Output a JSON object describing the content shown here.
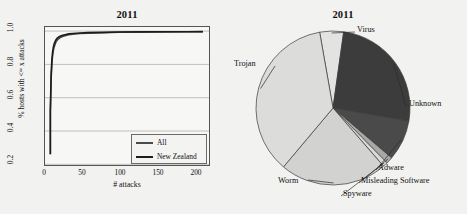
{
  "figure": {
    "background_color": "#f2f2f0",
    "panels": [
      "line-chart",
      "pie-chart"
    ]
  },
  "line_panel": {
    "title": "2011",
    "legend": {
      "entries": [
        {
          "label": "All",
          "color": "#4a4a4a"
        },
        {
          "label": "New Zealand",
          "color": "#1c1c1c"
        }
      ]
    }
  },
  "pie_panel": {
    "title": "2011"
  },
  "chart_data": [
    {
      "type": "line",
      "title": "2011",
      "xlabel": "# attacks",
      "ylabel": "% hosts with <= x attacks",
      "xlim": [
        -6,
        208
      ],
      "ylim": [
        0.13,
        1.03
      ],
      "xticks": [
        0,
        50,
        100,
        150,
        200
      ],
      "xtick_labels": [
        "0",
        "50",
        "100",
        "150",
        "200"
      ],
      "yticks": [
        0.2,
        0.4,
        0.6,
        0.8,
        1.0
      ],
      "ytick_labels": [
        "0.2",
        "0.4",
        "0.6",
        "0.8",
        "1.0"
      ],
      "grid": "horizontal",
      "legend_position": "lower right",
      "series": [
        {
          "name": "All",
          "color": "#4a4a4a",
          "x": [
            1,
            2,
            3,
            4,
            5,
            6,
            8,
            10,
            13,
            16,
            20,
            25,
            30,
            40,
            50,
            70,
            90,
            120,
            150,
            180,
            200
          ],
          "y": [
            0.482,
            0.69,
            0.79,
            0.845,
            0.878,
            0.9,
            0.928,
            0.944,
            0.958,
            0.966,
            0.973,
            0.979,
            0.983,
            0.987,
            0.99,
            0.993,
            0.995,
            0.997,
            0.998,
            0.999,
            0.999
          ]
        },
        {
          "name": "New Zealand",
          "color": "#1c1c1c",
          "x": [
            1,
            2,
            3,
            4,
            5,
            6,
            8,
            10,
            13,
            16,
            20,
            25,
            30,
            40,
            50,
            70,
            90,
            120,
            150,
            180,
            200
          ],
          "y": [
            0.482,
            0.718,
            0.818,
            0.87,
            0.9,
            0.92,
            0.944,
            0.957,
            0.968,
            0.975,
            0.98,
            0.985,
            0.988,
            0.991,
            0.993,
            0.995,
            0.997,
            0.998,
            0.999,
            0.999,
            1.0
          ]
        }
      ]
    },
    {
      "type": "pie",
      "title": "2011",
      "start_angle_deg": -100,
      "direction": "clockwise",
      "labels": [
        "Virus",
        "Unknown",
        "Adware",
        "Misleading Software",
        "Spyware",
        "Worm",
        "Trojan"
      ],
      "values": [
        5.0,
        25.5,
        8.5,
        1.4,
        1.0,
        22.5,
        36.1
      ],
      "colors": [
        "#e3e3e1",
        "#3c3c3c",
        "#4a4a4a",
        "#a8a8a6",
        "#d8d8d6",
        "#d2d2d0",
        "#dcdcda"
      ],
      "label_positions": [
        "top-right",
        "right",
        "bottom-right",
        "bottom-right",
        "bottom",
        "bottom-left",
        "left"
      ]
    }
  ]
}
